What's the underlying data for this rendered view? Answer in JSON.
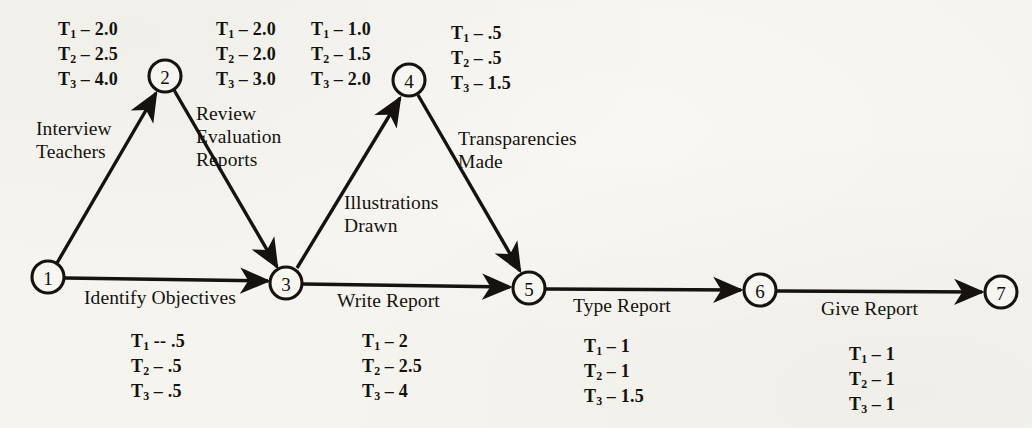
{
  "diagram": {
    "type": "pert-network",
    "nodes": [
      {
        "id": "1",
        "label": "1",
        "cx": 48,
        "cy": 277,
        "r": 16
      },
      {
        "id": "2",
        "label": "2",
        "cx": 165,
        "cy": 76,
        "r": 16
      },
      {
        "id": "3",
        "label": "3",
        "cx": 286,
        "cy": 283,
        "r": 16
      },
      {
        "id": "4",
        "label": "4",
        "cx": 409,
        "cy": 80,
        "r": 16
      },
      {
        "id": "5",
        "label": "5",
        "cx": 529,
        "cy": 288,
        "r": 16
      },
      {
        "id": "6",
        "label": "6",
        "cx": 760,
        "cy": 290,
        "r": 16
      },
      {
        "id": "7",
        "label": "7",
        "cx": 1001,
        "cy": 292,
        "r": 16
      }
    ],
    "edges": [
      {
        "id": "e12",
        "from": "1",
        "to": "2",
        "label": "Interview\nTeachers",
        "arrow": true
      },
      {
        "id": "e23",
        "from": "2",
        "to": "3",
        "label": "Review\nEvaluation\nReports",
        "arrow": true
      },
      {
        "id": "e13",
        "from": "1",
        "to": "3",
        "label": "Identify Objectives",
        "arrow": true
      },
      {
        "id": "e34",
        "from": "3",
        "to": "4",
        "label": "Illustrations\nDrawn",
        "arrow": true
      },
      {
        "id": "e45",
        "from": "4",
        "to": "5",
        "label": "Transparencies\nMade",
        "arrow": true
      },
      {
        "id": "e35",
        "from": "3",
        "to": "5",
        "label": "Write Report",
        "arrow": true
      },
      {
        "id": "e56",
        "from": "5",
        "to": "6",
        "label": "Type Report",
        "arrow": true
      },
      {
        "id": "e67",
        "from": "6",
        "to": "7",
        "label": "Give Report",
        "arrow": true
      }
    ],
    "time_blocks": [
      {
        "id": "t12",
        "edge": "e12",
        "rows": [
          {
            "var": "T",
            "sub": "1",
            "sep": " – ",
            "value": "2.0"
          },
          {
            "var": "T",
            "sub": "2",
            "sep": " – ",
            "value": "2.5"
          },
          {
            "var": "T",
            "sub": "3",
            "sep": " – ",
            "value": "4.0"
          }
        ]
      },
      {
        "id": "t23",
        "edge": "e23",
        "rows": [
          {
            "var": "T",
            "sub": "1",
            "sep": " – ",
            "value": "2.0"
          },
          {
            "var": "T",
            "sub": "2",
            "sep": " – ",
            "value": "2.0"
          },
          {
            "var": "T",
            "sub": "3",
            "sep": " – ",
            "value": "3.0"
          }
        ]
      },
      {
        "id": "t34",
        "edge": "e34",
        "rows": [
          {
            "var": "T",
            "sub": "1",
            "sep": " – ",
            "value": "1.0"
          },
          {
            "var": "T",
            "sub": "2",
            "sep": " – ",
            "value": "1.5"
          },
          {
            "var": "T",
            "sub": "3",
            "sep": " – ",
            "value": "2.0"
          }
        ]
      },
      {
        "id": "t45",
        "edge": "e45",
        "rows": [
          {
            "var": "T",
            "sub": "1",
            "sep": " – ",
            "value": ".5"
          },
          {
            "var": "T",
            "sub": "2",
            "sep": " – ",
            "value": ".5"
          },
          {
            "var": "T",
            "sub": "3",
            "sep": " – ",
            "value": "1.5"
          }
        ]
      },
      {
        "id": "t13",
        "edge": "e13",
        "rows": [
          {
            "var": "T",
            "sub": "1",
            "sep": " -- ",
            "value": ".5"
          },
          {
            "var": "T",
            "sub": "2",
            "sep": " – ",
            "value": ".5"
          },
          {
            "var": "T",
            "sub": "3",
            "sep": " – ",
            "value": ".5"
          }
        ]
      },
      {
        "id": "t35",
        "edge": "e35",
        "rows": [
          {
            "var": "T",
            "sub": "1",
            "sep": " – ",
            "value": "2"
          },
          {
            "var": "T",
            "sub": "2",
            "sep": " – ",
            "value": "2.5"
          },
          {
            "var": "T",
            "sub": "3",
            "sep": " – ",
            "value": "4"
          }
        ]
      },
      {
        "id": "t56",
        "edge": "e56",
        "rows": [
          {
            "var": "T",
            "sub": "1",
            "sep": " – ",
            "value": "1"
          },
          {
            "var": "T",
            "sub": "2",
            "sep": " – ",
            "value": "1"
          },
          {
            "var": "T",
            "sub": "3",
            "sep": " – ",
            "value": "1.5"
          }
        ]
      },
      {
        "id": "t67",
        "edge": "e67",
        "rows": [
          {
            "var": "T",
            "sub": "1",
            "sep": " – ",
            "value": "1"
          },
          {
            "var": "T",
            "sub": "2",
            "sep": " – ",
            "value": "1"
          },
          {
            "var": "T",
            "sub": "3",
            "sep": " – ",
            "value": "1"
          }
        ]
      }
    ],
    "colors": {
      "ink": "#14120e",
      "paper": "#f6f4ef"
    }
  }
}
